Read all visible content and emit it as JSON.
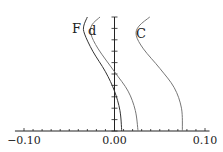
{
  "chart_data": {
    "type": "line",
    "title": "",
    "xlabel": "",
    "ylabel": "",
    "xlim": [
      -0.11,
      0.105
    ],
    "x_ticks": [
      -0.1,
      0.0,
      0.1
    ],
    "x_tick_labels": [
      "−0.10",
      "0.00",
      "0.10"
    ],
    "y_axis_ticks_count": 10,
    "grid": false,
    "legend": "inline labels",
    "series": [
      {
        "name": "F",
        "color": "#333333",
        "points": [
          [
            -0.03,
            1.0
          ],
          [
            -0.034,
            0.92
          ],
          [
            -0.033,
            0.85
          ],
          [
            -0.024,
            0.7
          ],
          [
            -0.01,
            0.52
          ],
          [
            0.0,
            0.35
          ],
          [
            0.006,
            0.18
          ],
          [
            0.008,
            0.0
          ]
        ]
      },
      {
        "name": "d",
        "color": "#777777",
        "points": [
          [
            -0.016,
            1.0
          ],
          [
            -0.025,
            0.93
          ],
          [
            -0.026,
            0.85
          ],
          [
            -0.018,
            0.72
          ],
          [
            0.0,
            0.52
          ],
          [
            0.015,
            0.35
          ],
          [
            0.023,
            0.18
          ],
          [
            0.026,
            0.0
          ]
        ]
      },
      {
        "name": "C",
        "color": "#777777",
        "points": [
          [
            0.039,
            1.0
          ],
          [
            0.027,
            0.92
          ],
          [
            0.024,
            0.84
          ],
          [
            0.032,
            0.72
          ],
          [
            0.05,
            0.55
          ],
          [
            0.066,
            0.38
          ],
          [
            0.074,
            0.2
          ],
          [
            0.075,
            0.0
          ]
        ]
      }
    ]
  }
}
